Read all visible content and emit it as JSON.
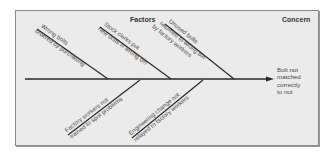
{
  "diagram": {
    "type": "fishbone",
    "headers": {
      "factors": "Factors",
      "concern": "Concern"
    },
    "effect": {
      "lines": [
        "Bolt not",
        "matched",
        "correctly",
        "to nut"
      ]
    },
    "causes": {
      "top": [
        {
          "line1": "Wrong bolts",
          "line2": "ordered by purchasing"
        },
        {
          "line1": "Stock clerks put",
          "line2": "new bolts in wrong bin"
        },
        {
          "line1": "Unused bolts",
          "line2": "returned to wrong bin",
          "line3": "by factory workers"
        }
      ],
      "bottom": [
        {
          "line1": "Factory workers not",
          "line2": "trained to spot problems"
        },
        {
          "line1": "Engineering change not",
          "line2": "relayed to factory workers"
        }
      ]
    },
    "colors": {
      "background": "#ebebeb",
      "border": "#8a8a8a",
      "line": "#2a2a2a",
      "text": "#4a4a4a"
    }
  }
}
